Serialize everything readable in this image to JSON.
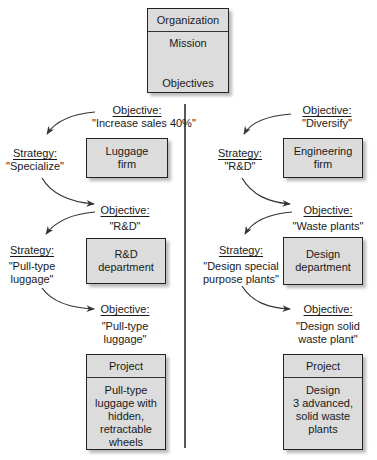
{
  "organization_box": {
    "header": "Organization",
    "mission": "Mission",
    "objectives": "Objectives"
  },
  "left_column": {
    "objective_1": {
      "heading": "Objective:",
      "value": "\"Increase sales 40%\""
    },
    "unit_1": {
      "lines": [
        "Luggage",
        "firm"
      ]
    },
    "strategy_1": {
      "heading": "Strategy:",
      "value": "\"Specialize\""
    },
    "objective_2": {
      "heading": "Objective:",
      "value": "\"R&D\""
    },
    "unit_2": {
      "lines": [
        "R&D",
        "department"
      ]
    },
    "strategy_2": {
      "heading": "Strategy:",
      "lines": [
        "\"Pull-type",
        "luggage\""
      ]
    },
    "objective_3": {
      "heading": "Objective:",
      "lines": [
        "\"Pull-type",
        "luggage\""
      ]
    },
    "project": {
      "header": "Project",
      "lines": [
        "Pull-type",
        "luggage with",
        "hidden,",
        "retractable",
        "wheels"
      ]
    }
  },
  "right_column": {
    "objective_1": {
      "heading": "Objective:",
      "value": "\"Diversify\""
    },
    "unit_1": {
      "lines": [
        "Engineering",
        "firm"
      ]
    },
    "strategy_1": {
      "heading": "Strategy:",
      "value": "\"R&D\""
    },
    "objective_2": {
      "heading": "Objective:",
      "value": "\"Waste plants\""
    },
    "unit_2": {
      "lines": [
        "Design",
        "department"
      ]
    },
    "strategy_2": {
      "heading": "Strategy:",
      "lines": [
        "\"Design special",
        "purpose plants\""
      ]
    },
    "objective_3": {
      "heading": "Objective:",
      "lines": [
        "\"Design solid",
        "waste plant\""
      ]
    },
    "project": {
      "header": "Project",
      "lines": [
        "Design",
        "3 advanced,",
        "solid waste",
        "plants"
      ]
    }
  },
  "colors": {
    "box_fill": "#dcdcdc",
    "stroke": "#222222",
    "arrow": "#333333"
  }
}
